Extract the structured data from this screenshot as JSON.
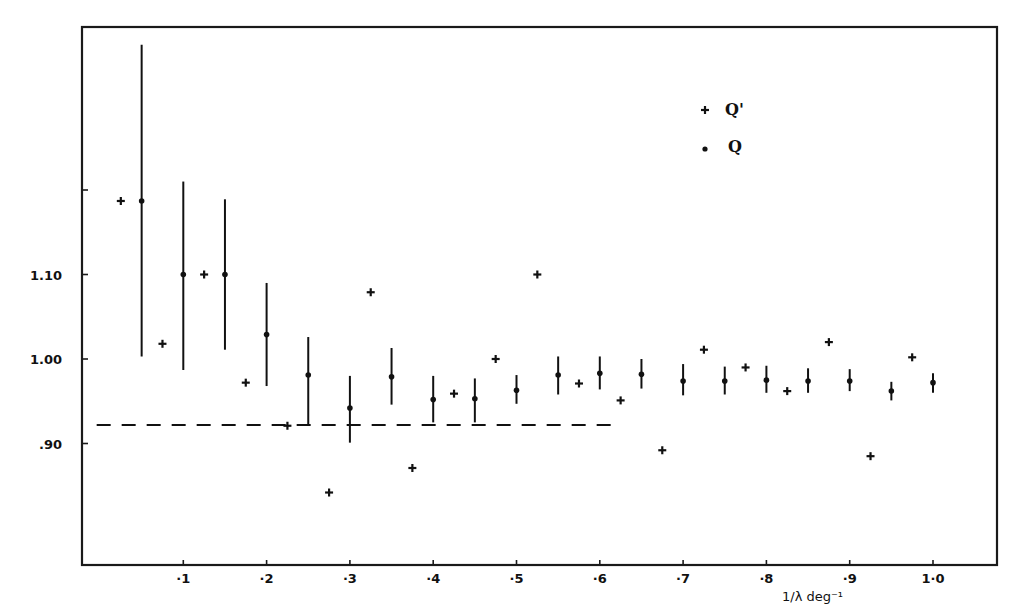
{
  "chart_data": {
    "type": "scatter",
    "title": "",
    "xlabel": "1/λ deg⁻¹",
    "ylabel": "",
    "xlim": [
      -0.02,
      1.075
    ],
    "ylim": [
      0.755,
      1.395
    ],
    "grid": false,
    "legend_position": "upper right (inside)",
    "x_ticks": [
      {
        "value": 0.1,
        "label": "·1"
      },
      {
        "value": 0.2,
        "label": "·2"
      },
      {
        "value": 0.3,
        "label": "·3"
      },
      {
        "value": 0.4,
        "label": "·4"
      },
      {
        "value": 0.5,
        "label": "·5"
      },
      {
        "value": 0.6,
        "label": "·6"
      },
      {
        "value": 0.7,
        "label": "·7"
      },
      {
        "value": 0.8,
        "label": "·8"
      },
      {
        "value": 0.9,
        "label": "·9"
      },
      {
        "value": 1.0,
        "label": "1·0"
      }
    ],
    "y_ticks": [
      {
        "value": 0.9,
        "label": ".90"
      },
      {
        "value": 1.0,
        "label": "1.00"
      },
      {
        "value": 1.1,
        "label": "1.10"
      },
      {
        "value": 1.2,
        "label": ""
      }
    ],
    "legend": [
      {
        "marker": "+",
        "label": "Q'"
      },
      {
        "marker": "•",
        "label": "Q"
      }
    ],
    "series": [
      {
        "name": "Q",
        "marker": "dot",
        "error_bars": true,
        "points": [
          {
            "x": 0.05,
            "y": 1.187,
            "lo": 1.003,
            "hi": 1.372
          },
          {
            "x": 0.1,
            "y": 1.1,
            "lo": 0.987,
            "hi": 1.21
          },
          {
            "x": 0.15,
            "y": 1.1,
            "lo": 1.011,
            "hi": 1.189
          },
          {
            "x": 0.2,
            "y": 1.029,
            "lo": 0.968,
            "hi": 1.09
          },
          {
            "x": 0.25,
            "y": 0.981,
            "lo": 0.922,
            "hi": 1.026
          },
          {
            "x": 0.3,
            "y": 0.942,
            "lo": 0.901,
            "hi": 0.98
          },
          {
            "x": 0.35,
            "y": 0.979,
            "lo": 0.946,
            "hi": 1.013
          },
          {
            "x": 0.4,
            "y": 0.952,
            "lo": 0.925,
            "hi": 0.98
          },
          {
            "x": 0.45,
            "y": 0.953,
            "lo": 0.925,
            "hi": 0.977
          },
          {
            "x": 0.5,
            "y": 0.963,
            "lo": 0.947,
            "hi": 0.981
          },
          {
            "x": 0.55,
            "y": 0.981,
            "lo": 0.958,
            "hi": 1.003
          },
          {
            "x": 0.6,
            "y": 0.983,
            "lo": 0.964,
            "hi": 1.003
          },
          {
            "x": 0.65,
            "y": 0.982,
            "lo": 0.965,
            "hi": 1.0
          },
          {
            "x": 0.7,
            "y": 0.974,
            "lo": 0.957,
            "hi": 0.994
          },
          {
            "x": 0.75,
            "y": 0.974,
            "lo": 0.958,
            "hi": 0.991
          },
          {
            "x": 0.8,
            "y": 0.975,
            "lo": 0.96,
            "hi": 0.992
          },
          {
            "x": 0.85,
            "y": 0.974,
            "lo": 0.96,
            "hi": 0.989
          },
          {
            "x": 0.9,
            "y": 0.974,
            "lo": 0.962,
            "hi": 0.988
          },
          {
            "x": 0.95,
            "y": 0.962,
            "lo": 0.951,
            "hi": 0.973
          },
          {
            "x": 1.0,
            "y": 0.972,
            "lo": 0.96,
            "hi": 0.983
          }
        ]
      },
      {
        "name": "Q'",
        "marker": "plus",
        "error_bars": false,
        "points": [
          {
            "x": 0.025,
            "y": 1.187
          },
          {
            "x": 0.075,
            "y": 1.018
          },
          {
            "x": 0.125,
            "y": 1.1
          },
          {
            "x": 0.175,
            "y": 0.972
          },
          {
            "x": 0.225,
            "y": 0.921
          },
          {
            "x": 0.275,
            "y": 0.842
          },
          {
            "x": 0.325,
            "y": 1.079
          },
          {
            "x": 0.375,
            "y": 0.871
          },
          {
            "x": 0.425,
            "y": 0.959
          },
          {
            "x": 0.475,
            "y": 1.0
          },
          {
            "x": 0.525,
            "y": 1.1
          },
          {
            "x": 0.575,
            "y": 0.971
          },
          {
            "x": 0.625,
            "y": 0.951
          },
          {
            "x": 0.675,
            "y": 0.892
          },
          {
            "x": 0.725,
            "y": 1.011
          },
          {
            "x": 0.775,
            "y": 0.99
          },
          {
            "x": 0.825,
            "y": 0.962
          },
          {
            "x": 0.875,
            "y": 1.02
          },
          {
            "x": 0.925,
            "y": 0.885
          },
          {
            "x": 0.975,
            "y": 1.002
          }
        ]
      }
    ],
    "reference_line": {
      "style": "dashed",
      "y": 0.922,
      "x_start": -0.004,
      "x_end": 0.626
    }
  }
}
